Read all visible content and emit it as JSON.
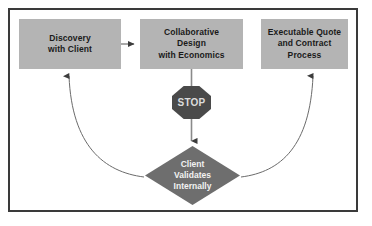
{
  "diagram": {
    "title_visible": false,
    "frame": {
      "border_color": "#3a3a3a",
      "background": "#ffffff"
    },
    "palette": {
      "box_fill": "#b4b4b4",
      "box_text": "#1a1a1a",
      "diamond_fill": "#6e6e6e",
      "diamond_text": "#f2f2f2",
      "stop_fill": "#4a4a4a",
      "stop_text": "#dcdcdc",
      "connector": "#555555"
    },
    "nodes": [
      {
        "id": "discovery",
        "shape": "rectangle",
        "label": "Discovery\nwith Client"
      },
      {
        "id": "collaborative-design",
        "shape": "rectangle",
        "label": "Collaborative\nDesign\nwith Economics"
      },
      {
        "id": "executable-quote",
        "shape": "rectangle",
        "label": "Executable Quote\nand Contract\nProcess"
      },
      {
        "id": "stop",
        "shape": "octagon",
        "label": "STOP"
      },
      {
        "id": "client-validates",
        "shape": "diamond",
        "label": "Client\nValidates\nInternally"
      }
    ],
    "connectors": [
      {
        "id": "discovery-to-design",
        "from": "discovery",
        "to": "collaborative-design",
        "style": "straight-arrow",
        "direction": "right"
      },
      {
        "id": "design-to-validate",
        "from": "collaborative-design",
        "to": "client-validates",
        "style": "straight-arrow",
        "direction": "down",
        "passes_through": "stop"
      },
      {
        "id": "validate-to-discovery",
        "from": "client-validates",
        "to": "discovery",
        "style": "curved-arrow",
        "direction": "up-left"
      },
      {
        "id": "validate-to-quote",
        "from": "client-validates",
        "to": "executable-quote",
        "style": "curved-arrow",
        "direction": "up-right"
      }
    ]
  }
}
